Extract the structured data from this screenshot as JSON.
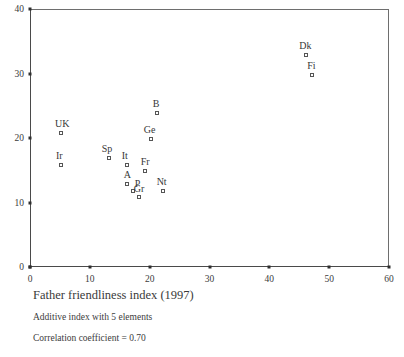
{
  "chart_data": {
    "type": "scatter",
    "title": "Father friendliness index (1997)",
    "subtitle": "Additive index with 5 elements",
    "annotation": "Correlation coefficient = 0.70",
    "xlabel": "",
    "ylabel": "",
    "xlim": [
      0,
      60
    ],
    "ylim": [
      0,
      40
    ],
    "xticks": [
      0,
      10,
      20,
      30,
      40,
      50,
      60
    ],
    "yticks": [
      0,
      10,
      20,
      30,
      40
    ],
    "xtick_labels": [
      "0",
      "10",
      "20",
      "30",
      "40",
      "50",
      "60"
    ],
    "ytick_labels": [
      "0",
      "10",
      "20",
      "30",
      "40"
    ],
    "grid": false,
    "legend": "none",
    "marker_style": "open-square",
    "points": [
      {
        "label": "UK",
        "x": 5,
        "y": 21,
        "label_dx": -5,
        "label_dy": -13
      },
      {
        "label": "Ir",
        "x": 5,
        "y": 16,
        "label_dx": -4,
        "label_dy": -13
      },
      {
        "label": "Sp",
        "x": 13,
        "y": 17,
        "label_dx": -6,
        "label_dy": -13
      },
      {
        "label": "It",
        "x": 16,
        "y": 16,
        "label_dx": -4,
        "label_dy": -13
      },
      {
        "label": "A",
        "x": 16,
        "y": 13,
        "label_dx": -2,
        "label_dy": -13
      },
      {
        "label": "P",
        "x": 17,
        "y": 12,
        "label_dx": 3,
        "label_dy": -11
      },
      {
        "label": "Gr",
        "x": 18,
        "y": 11,
        "label_dx": -4,
        "label_dy": -12
      },
      {
        "label": "Fr",
        "x": 19,
        "y": 15,
        "label_dx": -3,
        "label_dy": -13
      },
      {
        "label": "Ge",
        "x": 20,
        "y": 20,
        "label_dx": -6,
        "label_dy": -13
      },
      {
        "label": "B",
        "x": 21,
        "y": 24,
        "label_dx": -3,
        "label_dy": -13
      },
      {
        "label": "Nt",
        "x": 22,
        "y": 12,
        "label_dx": -5,
        "label_dy": -13
      },
      {
        "label": "Dk",
        "x": 46,
        "y": 33,
        "label_dx": -6,
        "label_dy": -13
      },
      {
        "label": "Fi",
        "x": 47,
        "y": 30,
        "label_dx": -4,
        "label_dy": -13
      }
    ]
  },
  "colors": {
    "axis": "#4a4a4a",
    "frame": "#6e6e6e",
    "marker_edge": "#555555",
    "marker_fill": "#ffffff",
    "text": "#3a3a3a",
    "background": "#ffffff"
  }
}
